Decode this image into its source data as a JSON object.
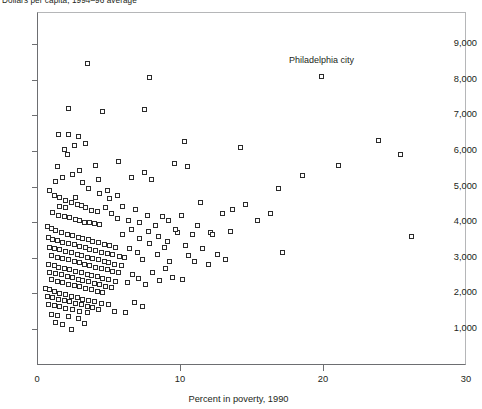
{
  "chart_data": {
    "type": "scatter",
    "title": "Dollars per capita, 1994–96 average",
    "xlabel": "Percent in poverty, 1990",
    "ylabel": "Dollars per capita, 1994–96 average",
    "xlim": [
      0,
      30
    ],
    "ylim": [
      0,
      9600
    ],
    "xticks": [
      0,
      10,
      20,
      30
    ],
    "xtick_labels": [
      "0",
      "10",
      "20",
      "30"
    ],
    "yticks": [
      1000,
      2000,
      3000,
      4000,
      5000,
      6000,
      7000,
      8000,
      9000
    ],
    "ytick_labels": [
      "1,000",
      "2,000",
      "3,000",
      "4,000",
      "5,000",
      "6,000",
      "7,000",
      "8,000",
      "9,000"
    ],
    "grid": false,
    "legend": null,
    "marker": "open-square",
    "marker_color": "#2b2b2b",
    "annotations": [
      {
        "text": "Philadelphia city",
        "x": 19.9,
        "y": 8450,
        "point_x": 19.9,
        "point_y": 8100
      }
    ],
    "points": [
      [
        3.5,
        8450
      ],
      [
        7.9,
        8050
      ],
      [
        19.9,
        8100
      ],
      [
        2.2,
        7200
      ],
      [
        7.5,
        7150
      ],
      [
        4.6,
        7100
      ],
      [
        1.5,
        6450
      ],
      [
        2.2,
        6450
      ],
      [
        2.6,
        6150
      ],
      [
        2.1,
        5900
      ],
      [
        10.3,
        6250
      ],
      [
        14.2,
        6100
      ],
      [
        23.9,
        6300
      ],
      [
        25.4,
        5900
      ],
      [
        1.3,
        5150
      ],
      [
        3.2,
        5100
      ],
      [
        4.3,
        5200
      ],
      [
        6.6,
        5250
      ],
      [
        7.5,
        5400
      ],
      [
        8.0,
        5200
      ],
      [
        9.6,
        5650
      ],
      [
        10.5,
        5550
      ],
      [
        16.9,
        4950
      ],
      [
        18.6,
        5300
      ],
      [
        21.1,
        5600
      ],
      [
        4.9,
        4880
      ],
      [
        0.9,
        4900
      ],
      [
        1.2,
        4750
      ],
      [
        1.6,
        4700
      ],
      [
        2.0,
        4620
      ],
      [
        2.4,
        4560
      ],
      [
        2.8,
        4500
      ],
      [
        3.1,
        4460
      ],
      [
        3.4,
        4400
      ],
      [
        3.8,
        4340
      ],
      [
        4.2,
        4300
      ],
      [
        1.1,
        4280
      ],
      [
        1.5,
        4200
      ],
      [
        1.9,
        4160
      ],
      [
        2.3,
        4120
      ],
      [
        2.7,
        4080
      ],
      [
        3.0,
        4050
      ],
      [
        3.3,
        4000
      ],
      [
        3.7,
        3980
      ],
      [
        4.0,
        3950
      ],
      [
        4.4,
        3920
      ],
      [
        4.8,
        4400
      ],
      [
        5.2,
        4250
      ],
      [
        5.6,
        4100
      ],
      [
        6.0,
        4450
      ],
      [
        6.4,
        4050
      ],
      [
        6.9,
        4350
      ],
      [
        7.2,
        4000
      ],
      [
        7.7,
        4200
      ],
      [
        8.3,
        3900
      ],
      [
        8.8,
        4150
      ],
      [
        9.2,
        4050
      ],
      [
        9.8,
        3700
      ],
      [
        10.1,
        4200
      ],
      [
        10.9,
        3650
      ],
      [
        11.4,
        4550
      ],
      [
        12.1,
        3700
      ],
      [
        13.0,
        4250
      ],
      [
        13.7,
        4350
      ],
      [
        0.7,
        3880
      ],
      [
        1.0,
        3820
      ],
      [
        1.3,
        3760
      ],
      [
        1.7,
        3700
      ],
      [
        2.1,
        3660
      ],
      [
        2.5,
        3620
      ],
      [
        2.9,
        3580
      ],
      [
        3.2,
        3540
      ],
      [
        3.6,
        3500
      ],
      [
        3.9,
        3460
      ],
      [
        4.3,
        3420
      ],
      [
        4.7,
        3380
      ],
      [
        5.1,
        3340
      ],
      [
        5.5,
        3300
      ],
      [
        0.8,
        3580
      ],
      [
        1.1,
        3520
      ],
      [
        1.4,
        3480
      ],
      [
        1.8,
        3440
      ],
      [
        2.2,
        3400
      ],
      [
        2.6,
        3360
      ],
      [
        3.0,
        3320
      ],
      [
        3.4,
        3280
      ],
      [
        3.7,
        3240
      ],
      [
        4.1,
        3200
      ],
      [
        4.5,
        3160
      ],
      [
        4.9,
        3120
      ],
      [
        5.3,
        3080
      ],
      [
        5.8,
        3040
      ],
      [
        0.9,
        3300
      ],
      [
        1.2,
        3260
      ],
      [
        1.6,
        3220
      ],
      [
        2.0,
        3180
      ],
      [
        2.4,
        3140
      ],
      [
        2.8,
        3100
      ],
      [
        3.1,
        3060
      ],
      [
        3.5,
        3020
      ],
      [
        3.9,
        2980
      ],
      [
        4.3,
        2940
      ],
      [
        4.7,
        2900
      ],
      [
        5.0,
        2860
      ],
      [
        5.4,
        2820
      ],
      [
        5.9,
        2780
      ],
      [
        1.0,
        3060
      ],
      [
        1.4,
        3020
      ],
      [
        1.8,
        2980
      ],
      [
        2.2,
        2940
      ],
      [
        2.6,
        2900
      ],
      [
        3.0,
        2860
      ],
      [
        3.3,
        2820
      ],
      [
        3.7,
        2780
      ],
      [
        4.1,
        2740
      ],
      [
        4.5,
        2700
      ],
      [
        4.9,
        2660
      ],
      [
        5.3,
        2620
      ],
      [
        5.7,
        2580
      ],
      [
        0.8,
        2820
      ],
      [
        1.2,
        2780
      ],
      [
        1.5,
        2740
      ],
      [
        1.9,
        2700
      ],
      [
        2.3,
        2660
      ],
      [
        2.7,
        2620
      ],
      [
        3.1,
        2580
      ],
      [
        3.5,
        2540
      ],
      [
        3.8,
        2500
      ],
      [
        4.2,
        2460
      ],
      [
        4.6,
        2420
      ],
      [
        5.0,
        2380
      ],
      [
        5.5,
        2340
      ],
      [
        0.9,
        2600
      ],
      [
        1.3,
        2560
      ],
      [
        1.7,
        2520
      ],
      [
        2.1,
        2480
      ],
      [
        2.5,
        2440
      ],
      [
        2.9,
        2400
      ],
      [
        3.2,
        2360
      ],
      [
        3.6,
        2320
      ],
      [
        4.0,
        2280
      ],
      [
        4.4,
        2240
      ],
      [
        4.8,
        2200
      ],
      [
        5.2,
        2160
      ],
      [
        1.0,
        2380
      ],
      [
        1.4,
        2340
      ],
      [
        1.8,
        2300
      ],
      [
        2.2,
        2260
      ],
      [
        2.6,
        2220
      ],
      [
        3.0,
        2180
      ],
      [
        3.4,
        2140
      ],
      [
        3.8,
        2100
      ],
      [
        4.2,
        2060
      ],
      [
        4.6,
        2020
      ],
      [
        0.6,
        2150
      ],
      [
        0.9,
        2100
      ],
      [
        1.2,
        2050
      ],
      [
        1.6,
        2000
      ],
      [
        2.0,
        1960
      ],
      [
        2.4,
        1920
      ],
      [
        2.8,
        1880
      ],
      [
        3.2,
        1840
      ],
      [
        3.6,
        1800
      ],
      [
        4.0,
        1760
      ],
      [
        4.5,
        1720
      ],
      [
        5.0,
        1680
      ],
      [
        0.7,
        1920
      ],
      [
        1.1,
        1880
      ],
      [
        1.5,
        1840
      ],
      [
        1.9,
        1800
      ],
      [
        2.3,
        1760
      ],
      [
        2.7,
        1720
      ],
      [
        3.1,
        1680
      ],
      [
        3.5,
        1640
      ],
      [
        3.9,
        1600
      ],
      [
        4.3,
        1560
      ],
      [
        0.8,
        1700
      ],
      [
        1.2,
        1660
      ],
      [
        1.6,
        1620
      ],
      [
        2.0,
        1580
      ],
      [
        2.5,
        1540
      ],
      [
        3.0,
        1500
      ],
      [
        3.5,
        1460
      ],
      [
        1.0,
        1420
      ],
      [
        1.4,
        1380
      ],
      [
        2.2,
        1340
      ],
      [
        2.9,
        1300
      ],
      [
        1.3,
        1180
      ],
      [
        1.8,
        1120
      ],
      [
        2.4,
        1000
      ],
      [
        3.3,
        1150
      ],
      [
        6.2,
        1450
      ],
      [
        5.4,
        1500
      ],
      [
        6.8,
        1750
      ],
      [
        7.4,
        1620
      ],
      [
        6.3,
        2300
      ],
      [
        6.7,
        2520
      ],
      [
        7.1,
        2420
      ],
      [
        7.6,
        2250
      ],
      [
        8.1,
        2600
      ],
      [
        8.6,
        2350
      ],
      [
        9.0,
        2700
      ],
      [
        9.5,
        2450
      ],
      [
        6.1,
        3000
      ],
      [
        6.5,
        3250
      ],
      [
        7.0,
        3150
      ],
      [
        7.4,
        2950
      ],
      [
        7.9,
        3400
      ],
      [
        8.4,
        3100
      ],
      [
        8.9,
        3300
      ],
      [
        9.3,
        2900
      ],
      [
        6.0,
        3650
      ],
      [
        6.6,
        3800
      ],
      [
        7.2,
        3550
      ],
      [
        7.8,
        3750
      ],
      [
        8.5,
        3600
      ],
      [
        9.1,
        3450
      ],
      [
        9.7,
        3800
      ],
      [
        10.2,
        2400
      ],
      [
        10.6,
        3050
      ],
      [
        10.4,
        3350
      ],
      [
        11.0,
        2900
      ],
      [
        11.6,
        3250
      ],
      [
        12.0,
        2800
      ],
      [
        12.6,
        3100
      ],
      [
        13.2,
        2950
      ],
      [
        11.2,
        3900
      ],
      [
        12.3,
        3650
      ],
      [
        13.5,
        3750
      ],
      [
        14.6,
        4500
      ],
      [
        15.4,
        4050
      ],
      [
        16.3,
        4250
      ],
      [
        17.2,
        3150
      ],
      [
        26.2,
        3600
      ],
      [
        5.7,
        5700
      ],
      [
        4.1,
        5600
      ],
      [
        3.0,
        5450
      ],
      [
        2.5,
        5350
      ],
      [
        1.8,
        5250
      ],
      [
        1.4,
        5550
      ],
      [
        2.9,
        6400
      ],
      [
        3.4,
        6200
      ],
      [
        1.9,
        6050
      ],
      [
        5.1,
        4650
      ],
      [
        5.6,
        4750
      ],
      [
        4.4,
        4800
      ],
      [
        3.6,
        4950
      ],
      [
        2.7,
        4680
      ],
      [
        2.0,
        4400
      ],
      [
        1.6,
        4450
      ]
    ]
  }
}
